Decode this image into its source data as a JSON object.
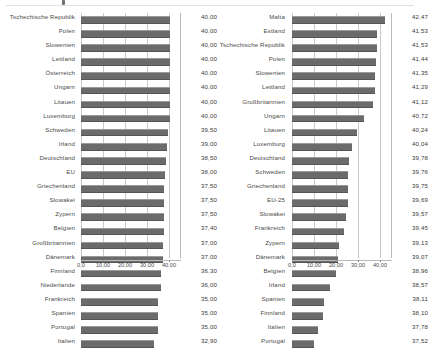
{
  "chart_data": [
    {
      "type": "bar",
      "id": "left",
      "title": "",
      "xlabel": "",
      "ylabel": "",
      "orientation": "horizontal",
      "grid": true,
      "legend": "none",
      "xlim": [
        0,
        45
      ],
      "xticks": [
        "0,0",
        "10,00",
        "20,00",
        "30,00",
        "40,00"
      ],
      "xtick_values": [
        0,
        10,
        20,
        30,
        40
      ],
      "categories": [
        "Tschechische Republik",
        "Polen",
        "Slowenien",
        "Lettland",
        "Österreich",
        "Ungarn",
        "Litauen",
        "Luxemburg",
        "Schweden",
        "Irland",
        "Deutschland",
        "EU",
        "Griechenland",
        "Slowakei",
        "Zypern",
        "Belgien",
        "Großbritannien",
        "Dänemark",
        "Finnland",
        "Niederlande",
        "Frankreich",
        "Spanien",
        "Portugal",
        "Italien"
      ],
      "values": [
        40.0,
        40.0,
        40.0,
        40.0,
        40.0,
        40.0,
        40.0,
        40.0,
        39.5,
        39.0,
        38.5,
        38.0,
        37.5,
        37.5,
        37.5,
        37.4,
        37.0,
        37.0,
        36.3,
        36.0,
        35.0,
        35.0,
        35.0,
        32.9
      ],
      "value_labels": [
        "40,00",
        "40,00",
        "40,00",
        "40,00",
        "40,00",
        "40,00",
        "40,00",
        "40,00",
        "39,50",
        "39,00",
        "38,50",
        "38,00",
        "37,50",
        "37,50",
        "37,50",
        "37,40",
        "37,00",
        "37,00",
        "36,30",
        "36,00",
        "35,00",
        "35,00",
        "35,00",
        "32,90"
      ],
      "bar_pixel_widths": [
        88.5,
        88.5,
        88.5,
        88.5,
        88.5,
        88.5,
        88.5,
        88.5,
        87.4,
        86.3,
        85.2,
        84.1,
        83.0,
        83.0,
        83.0,
        82.7,
        81.9,
        81.9,
        80.3,
        79.7,
        77.4,
        77.4,
        77.4,
        72.8
      ]
    },
    {
      "type": "bar",
      "id": "right",
      "title": "",
      "xlabel": "",
      "ylabel": "",
      "orientation": "horizontal",
      "grid": true,
      "legend": "none",
      "xlim": [
        0,
        45
      ],
      "xticks": [
        "0,0",
        "10,00",
        "20,00",
        "30,00",
        "40,00"
      ],
      "xtick_values": [
        0,
        10,
        20,
        30,
        40
      ],
      "categories": [
        "Malta",
        "Estland",
        "Tschechische Republik",
        "Polen",
        "Slowenien",
        "Lettland",
        "Großbritannien",
        "Ungarn",
        "Litauen",
        "Luxemburg",
        "Deutschland",
        "Schweden",
        "Griechenland",
        "EU-25",
        "Slowakei",
        "Frankreich",
        "Zypern",
        "Dänemark",
        "Belgien",
        "Irland",
        "Spanien",
        "Finnland",
        "Italien",
        "Portugal"
      ],
      "values": [
        42.47,
        41.53,
        41.53,
        41.44,
        41.35,
        41.29,
        41.12,
        40.72,
        40.24,
        40.04,
        39.78,
        39.76,
        39.75,
        39.69,
        39.57,
        39.45,
        39.13,
        39.07,
        38.96,
        38.57,
        38.11,
        38.1,
        37.78,
        37.52
      ],
      "value_labels": [
        "42,47",
        "41,53",
        "41,53",
        "41,44",
        "41,35",
        "41,29",
        "41,12",
        "40,72",
        "40,24",
        "40,04",
        "39,78",
        "39,76",
        "39,75",
        "39,69",
        "39,57",
        "39,45",
        "39,13",
        "39,07",
        "38,96",
        "38,57",
        "38,11",
        "38,10",
        "37,78",
        "37,52"
      ],
      "bar_pixel_widths": [
        93.0,
        84.5,
        84.5,
        83.8,
        83.0,
        82.5,
        81.0,
        72.0,
        65.0,
        60.0,
        56.5,
        56.0,
        56.0,
        55.5,
        53.5,
        51.5,
        46.5,
        45.5,
        44.0,
        37.5,
        31.5,
        31.0,
        25.5,
        22.0
      ]
    }
  ]
}
